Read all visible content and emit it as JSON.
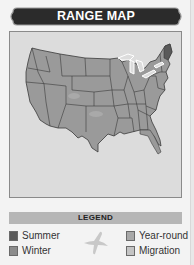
{
  "header": {
    "title": "RANGE MAP"
  },
  "map": {
    "region": "Contiguous United States",
    "base_color": "#9a9a9a",
    "highlight_regions": [
      {
        "name": "Maine",
        "category": "Summer"
      }
    ]
  },
  "legend": {
    "title": "LEGEND",
    "items": [
      {
        "label": "Summer",
        "color": "#5a5a5a",
        "position": "left"
      },
      {
        "label": "Winter",
        "color": "#8c8c8c",
        "position": "left"
      },
      {
        "label": "Year-round",
        "color": "#a8a8a8",
        "position": "right"
      },
      {
        "label": "Migration",
        "color": "#c4c4c4",
        "position": "right"
      }
    ],
    "icon": "bird-silhouette-icon"
  }
}
